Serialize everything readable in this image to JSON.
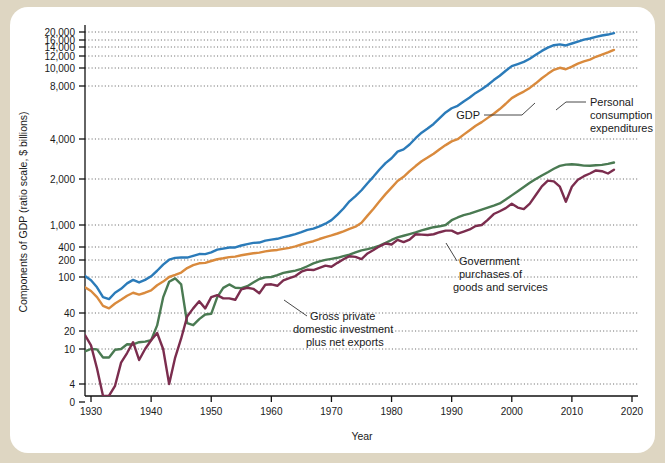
{
  "figure": {
    "background_outer": "#ded6c2",
    "background_inner": "#ffffff"
  },
  "chart_data": {
    "type": "line",
    "title": "",
    "xlabel": "Year",
    "ylabel": "Components of GDP (ratio scale, $ billions)",
    "scale": "log",
    "grid": true,
    "legend_position": "inline-annotations",
    "xlim": [
      1929,
      2021
    ],
    "xticks": [
      1930,
      1940,
      1950,
      1960,
      1970,
      1980,
      1990,
      2000,
      2010,
      2020
    ],
    "xtick_labels": [
      "1930",
      "1940",
      "1950",
      "1960",
      "1970",
      "1980",
      "1990",
      "2000",
      "2010",
      "2020"
    ],
    "yticks": [
      0,
      4,
      10,
      20,
      40,
      100,
      200,
      400,
      1000,
      2000,
      4000,
      8000,
      10000,
      12000,
      14000,
      16000,
      20000
    ],
    "ytick_labels": [
      "0",
      "4",
      "10",
      "20",
      "40",
      "100",
      "200",
      "400",
      "1,000",
      "2,000",
      "4,000",
      "8,000",
      "10,000",
      "12,000",
      "14,000",
      "16,000",
      "20,000"
    ],
    "colors": {
      "gdp": "#2b7bb9",
      "personal_consumption": "#d98a3d",
      "government": "#4a7a52",
      "investment": "#7b2d4e"
    },
    "annotations": [
      {
        "name": "gdp",
        "text": "GDP"
      },
      {
        "name": "personal-consumption",
        "text": "Personal\nconsumption\nexpenditures"
      },
      {
        "name": "government",
        "text": "Government\npurchases of\ngoods and services"
      },
      {
        "name": "investment",
        "text": "Gross private\ndomestic investment\nplus net exports"
      }
    ],
    "annotation_text": {
      "gdp": "GDP",
      "pce_l1": "Personal",
      "pce_l2": "consumption",
      "pce_l3": "expenditures",
      "gov_l1": "Government",
      "gov_l2": "purchases of",
      "gov_l3": "goods and services",
      "inv_l1": "Gross private",
      "inv_l2": "domestic investment",
      "inv_l3": "plus net exports"
    },
    "x": [
      1929,
      1930,
      1931,
      1932,
      1933,
      1934,
      1935,
      1936,
      1937,
      1938,
      1939,
      1940,
      1941,
      1942,
      1943,
      1944,
      1945,
      1946,
      1947,
      1948,
      1949,
      1950,
      1951,
      1952,
      1953,
      1954,
      1955,
      1956,
      1957,
      1958,
      1959,
      1960,
      1961,
      1962,
      1963,
      1964,
      1965,
      1966,
      1967,
      1968,
      1969,
      1970,
      1971,
      1972,
      1973,
      1974,
      1975,
      1976,
      1977,
      1978,
      1979,
      1980,
      1981,
      1982,
      1983,
      1984,
      1985,
      1986,
      1987,
      1988,
      1989,
      1990,
      1991,
      1992,
      1993,
      1994,
      1995,
      1996,
      1997,
      1998,
      1999,
      2000,
      2001,
      2002,
      2003,
      2004,
      2005,
      2006,
      2007,
      2008,
      2009,
      2010,
      2011,
      2012,
      2013,
      2014,
      2015,
      2016,
      2017
    ],
    "series": [
      {
        "name": "GDP",
        "color": "#2b7bb9",
        "values": [
          104,
          92,
          77,
          60,
          57,
          67,
          74,
          85,
          93,
          87,
          93,
          103,
          129,
          166,
          203,
          224,
          228,
          228,
          250,
          275,
          273,
          300,
          347,
          368,
          389,
          391,
          426,
          450,
          474,
          482,
          522,
          543,
          563,
          605,
          639,
          686,
          744,
          815,
          862,
          942,
          1020,
          1076,
          1168,
          1282,
          1429,
          1546,
          1688,
          1877,
          2086,
          2357,
          2632,
          2863,
          3211,
          3345,
          3638,
          4041,
          4347,
          4590,
          4870,
          5253,
          5658,
          5980,
          6174,
          6539,
          6879,
          7309,
          7664,
          8100,
          8609,
          9089,
          9661,
          10285,
          10622,
          10978,
          11511,
          12275,
          13094,
          13856,
          14478,
          14719,
          14419,
          14964,
          15518,
          16155,
          16692,
          17428,
          18121,
          18625,
          19391
        ]
      },
      {
        "name": "Personal consumption expenditures",
        "color": "#d98a3d",
        "values": [
          77,
          70,
          60,
          48,
          45,
          51,
          56,
          62,
          67,
          64,
          67,
          71,
          81,
          89,
          100,
          109,
          120,
          144,
          162,
          175,
          178,
          192,
          208,
          219,
          233,
          240,
          258,
          271,
          286,
          296,
          317,
          331,
          342,
          363,
          383,
          412,
          444,
          481,
          509,
          558,
          605,
          647,
          702,
          770,
          852,
          933,
          1034,
          1152,
          1278,
          1428,
          1592,
          1757,
          1941,
          2077,
          2290,
          2503,
          2720,
          2899,
          3100,
          3353,
          3598,
          3840,
          3986,
          4236,
          4484,
          4751,
          4987,
          5273,
          5570,
          5918,
          6343,
          6830,
          7149,
          7439,
          7804,
          8270,
          8803,
          9301,
          9773,
          10036,
          9846,
          10202,
          10689,
          11051,
          11361,
          11863,
          12284,
          12748,
          13321
        ]
      },
      {
        "name": "Government purchases of goods and services",
        "color": "#4a7a52",
        "values": [
          9.4,
          10.0,
          9.9,
          8.0,
          8.0,
          9.8,
          10.0,
          12.0,
          11.9,
          13.0,
          13.3,
          14.0,
          24.8,
          59.5,
          88.6,
          96.5,
          83.0,
          27.0,
          25.0,
          31.6,
          37.8,
          38.8,
          60.0,
          75.8,
          82.8,
          76.0,
          75.3,
          79.0,
          87.1,
          95.0,
          99.0,
          100.0,
          108.0,
          118.0,
          124.0,
          130.0,
          139.0,
          155.0,
          174.0,
          189.0,
          201.0,
          213.0,
          225.0,
          245.0,
          265.0,
          299.0,
          335.0,
          357.0,
          388.0,
          425.0,
          475.0,
          536.0,
          595.0,
          639.0,
          686.0,
          738.0,
          800.0,
          855.0,
          913.0,
          947.0,
          1000.0,
          1075.0,
          1120.0,
          1159.0,
          1186.0,
          1222.0,
          1260.0,
          1300.0,
          1340.0,
          1385.0,
          1467.0,
          1563.0,
          1663.0,
          1771.0,
          1889.0,
          2000.0,
          2125.0,
          2248.0,
          2387.0,
          2508.0,
          2567.0,
          2580.0,
          2563.0,
          2523.0,
          2513.0,
          2535.0,
          2555.0,
          2600.0,
          2660.0
        ]
      },
      {
        "name": "Gross private domestic investment plus net exports",
        "color": "#7b2d4e",
        "values": [
          17.0,
          11.5,
          6.0,
          1.0,
          1.4,
          3.6,
          7.0,
          9.0,
          13.0,
          7.5,
          10.0,
          14.0,
          18.5,
          10.0,
          4.0,
          8.0,
          15.0,
          35.0,
          45.0,
          54.0,
          45.0,
          60.0,
          63.0,
          58.0,
          58.0,
          56.0,
          73.0,
          76.0,
          74.0,
          66.0,
          82.0,
          83.0,
          80.0,
          92.0,
          97.0,
          104.0,
          124.0,
          135.0,
          133.0,
          145.0,
          159.0,
          152.0,
          178.0,
          208.0,
          245.0,
          237.0,
          210.0,
          283.0,
          340.0,
          411.0,
          463.0,
          445.0,
          538.0,
          490.0,
          545.0,
          680.0,
          670.0,
          660.0,
          680.0,
          740.0,
          790.0,
          790.0,
          700.0,
          760.0,
          830.0,
          960.0,
          1000.0,
          1080.0,
          1180.0,
          1230.0,
          1290.0,
          1380.0,
          1300.0,
          1270.0,
          1380.0,
          1570.0,
          1790.0,
          1950.0,
          1930.0,
          1780.0,
          1420.0,
          1780.0,
          1980.0,
          2100.0,
          2200.0,
          2320.0,
          2290.0,
          2200.0,
          2350.0
        ]
      }
    ]
  }
}
